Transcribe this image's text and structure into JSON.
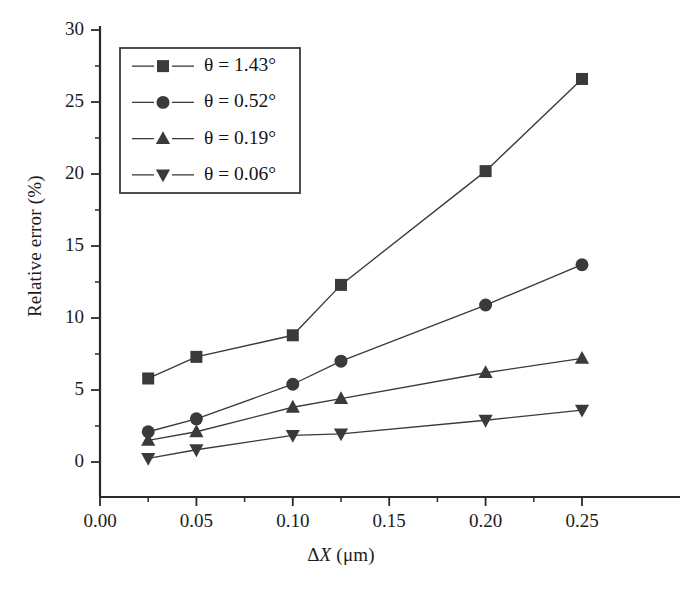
{
  "chart_data": {
    "type": "line",
    "title": "",
    "subtitle": "",
    "xlabel": "ΔX (μm)",
    "ylabel": "Relative error (%)",
    "xlim": [
      0.0,
      0.2725
    ],
    "ylim": [
      0,
      30
    ],
    "xticks": [
      0.0,
      0.05,
      0.1,
      0.15,
      0.2,
      0.25
    ],
    "xtick_labels": [
      "0.00",
      "0.05",
      "0.10",
      "0.15",
      "0.20",
      "0.25"
    ],
    "xminor_step": 0.025,
    "yticks": [
      0,
      5,
      10,
      15,
      20,
      25,
      30
    ],
    "ytick_labels": [
      "0",
      "5",
      "10",
      "15",
      "20",
      "25",
      "30"
    ],
    "yminor_step": 2.5,
    "grid": false,
    "legend_position": "upper left",
    "x": [
      0.025,
      0.05,
      0.1,
      0.125,
      0.2,
      0.25
    ],
    "series": [
      {
        "name": "θ = 1.43°",
        "marker": "square",
        "color": "#3a3a3a",
        "values": [
          5.8,
          7.3,
          8.8,
          12.3,
          20.2,
          26.6
        ]
      },
      {
        "name": "θ = 0.52°",
        "marker": "circle",
        "color": "#3a3a3a",
        "values": [
          2.1,
          3.0,
          5.4,
          7.0,
          10.9,
          13.7
        ]
      },
      {
        "name": "θ = 0.19°",
        "marker": "triangle-up",
        "color": "#3a3a3a",
        "values": [
          1.5,
          2.1,
          3.8,
          4.4,
          6.2,
          7.2
        ]
      },
      {
        "name": "θ = 0.06°",
        "marker": "triangle-down",
        "color": "#3a3a3a",
        "values": [
          0.25,
          0.85,
          1.85,
          1.95,
          2.9,
          3.6
        ]
      }
    ]
  },
  "axes": {
    "x_title_prefix": "Δ",
    "x_title_italic": "X",
    "x_title_suffix": " (μm)",
    "y_title": "Relative error (%)"
  },
  "legend": {
    "entries": [
      {
        "label": "θ = 1.43°",
        "marker": "square"
      },
      {
        "label": "θ = 0.52°",
        "marker": "circle"
      },
      {
        "label": "θ = 0.19°",
        "marker": "triangle-up"
      },
      {
        "label": "θ = 0.06°",
        "marker": "triangle-down"
      }
    ]
  }
}
